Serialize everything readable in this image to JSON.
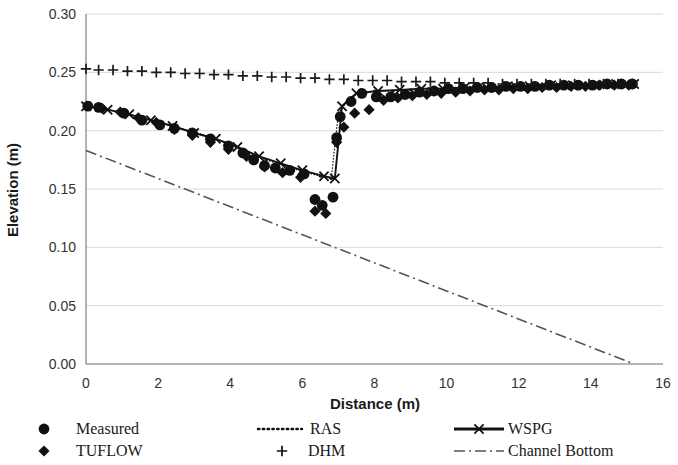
{
  "chart_data": {
    "type": "scatter",
    "title": "",
    "xlabel": "Distance (m)",
    "ylabel": "Elevation (m)",
    "xlim": [
      0,
      16
    ],
    "ylim": [
      0.0,
      0.3
    ],
    "xticks": [
      0,
      2,
      4,
      6,
      8,
      10,
      12,
      14,
      16
    ],
    "yticks": [
      0.0,
      0.05,
      0.1,
      0.15,
      0.2,
      0.25,
      0.3
    ],
    "xtick_labels": [
      "0",
      "2",
      "4",
      "6",
      "8",
      "10",
      "12",
      "14",
      "16"
    ],
    "ytick_labels": [
      "0.00",
      "0.05",
      "0.10",
      "0.15",
      "0.20",
      "0.25",
      "0.30"
    ],
    "grid": "horizontal",
    "legend_position": "bottom",
    "series": [
      {
        "name": "Measured",
        "marker": "filled-circle",
        "style": "markers",
        "color": "#111111",
        "points": [
          [
            0.05,
            0.221
          ],
          [
            0.35,
            0.22
          ],
          [
            1.05,
            0.215
          ],
          [
            1.55,
            0.209
          ],
          [
            2.05,
            0.205
          ],
          [
            2.45,
            0.202
          ],
          [
            2.95,
            0.198
          ],
          [
            3.45,
            0.193
          ],
          [
            3.95,
            0.187
          ],
          [
            4.35,
            0.181
          ],
          [
            4.65,
            0.175
          ],
          [
            4.95,
            0.17
          ],
          [
            5.25,
            0.168
          ],
          [
            5.65,
            0.166
          ],
          [
            6.05,
            0.163
          ],
          [
            6.35,
            0.141
          ],
          [
            6.55,
            0.136
          ],
          [
            6.85,
            0.143
          ],
          [
            6.95,
            0.194
          ],
          [
            7.05,
            0.212
          ],
          [
            7.35,
            0.225
          ],
          [
            7.65,
            0.232
          ],
          [
            8.05,
            0.229
          ],
          [
            8.45,
            0.229
          ],
          [
            8.85,
            0.231
          ],
          [
            9.25,
            0.233
          ],
          [
            9.65,
            0.234
          ],
          [
            10.05,
            0.236
          ],
          [
            10.45,
            0.236
          ],
          [
            10.85,
            0.237
          ],
          [
            11.25,
            0.237
          ],
          [
            11.65,
            0.238
          ],
          [
            12.05,
            0.238
          ],
          [
            12.45,
            0.238
          ],
          [
            12.85,
            0.239
          ],
          [
            13.25,
            0.239
          ],
          [
            13.65,
            0.239
          ],
          [
            14.05,
            0.239
          ],
          [
            14.45,
            0.24
          ],
          [
            14.85,
            0.24
          ],
          [
            15.15,
            0.24
          ]
        ]
      },
      {
        "name": "TUFLOW",
        "marker": "filled-diamond",
        "style": "markers",
        "color": "#111111",
        "points": [
          [
            0.45,
            0.219
          ],
          [
            0.95,
            0.216
          ],
          [
            1.45,
            0.211
          ],
          [
            1.95,
            0.207
          ],
          [
            2.45,
            0.201
          ],
          [
            2.95,
            0.196
          ],
          [
            3.45,
            0.19
          ],
          [
            3.95,
            0.184
          ],
          [
            4.45,
            0.178
          ],
          [
            4.95,
            0.169
          ],
          [
            5.45,
            0.164
          ],
          [
            5.95,
            0.16
          ],
          [
            6.35,
            0.131
          ],
          [
            6.65,
            0.129
          ],
          [
            6.95,
            0.19
          ],
          [
            7.15,
            0.203
          ],
          [
            7.45,
            0.215
          ],
          [
            7.85,
            0.218
          ],
          [
            8.25,
            0.226
          ],
          [
            8.65,
            0.228
          ],
          [
            9.05,
            0.23
          ],
          [
            9.45,
            0.231
          ],
          [
            9.85,
            0.232
          ],
          [
            10.25,
            0.233
          ],
          [
            10.65,
            0.234
          ],
          [
            11.05,
            0.235
          ],
          [
            11.45,
            0.235
          ],
          [
            11.85,
            0.236
          ],
          [
            12.25,
            0.236
          ],
          [
            12.65,
            0.237
          ],
          [
            13.05,
            0.237
          ],
          [
            13.45,
            0.238
          ],
          [
            13.85,
            0.238
          ],
          [
            14.25,
            0.239
          ],
          [
            14.65,
            0.239
          ],
          [
            15.05,
            0.239
          ]
        ]
      },
      {
        "name": "RAS",
        "marker": "small-dot",
        "style": "dotted-line",
        "color": "#1a1a1a",
        "points": [
          [
            0.0,
            0.221
          ],
          [
            0.5,
            0.219
          ],
          [
            1.0,
            0.215
          ],
          [
            1.5,
            0.211
          ],
          [
            2.0,
            0.207
          ],
          [
            2.5,
            0.203
          ],
          [
            3.0,
            0.199
          ],
          [
            3.5,
            0.194
          ],
          [
            4.0,
            0.188
          ],
          [
            4.5,
            0.181
          ],
          [
            5.0,
            0.175
          ],
          [
            5.5,
            0.17
          ],
          [
            6.0,
            0.165
          ],
          [
            6.5,
            0.161
          ],
          [
            6.8,
            0.159
          ],
          [
            7.0,
            0.215
          ],
          [
            7.3,
            0.228
          ],
          [
            7.6,
            0.233
          ],
          [
            8.0,
            0.234
          ],
          [
            8.5,
            0.234
          ],
          [
            9.0,
            0.235
          ],
          [
            9.5,
            0.236
          ],
          [
            10.0,
            0.236
          ],
          [
            10.5,
            0.237
          ],
          [
            11.0,
            0.237
          ],
          [
            11.5,
            0.238
          ],
          [
            12.0,
            0.238
          ],
          [
            12.5,
            0.238
          ],
          [
            13.0,
            0.239
          ],
          [
            13.5,
            0.239
          ],
          [
            14.0,
            0.239
          ],
          [
            14.5,
            0.24
          ],
          [
            15.0,
            0.24
          ],
          [
            15.2,
            0.24
          ]
        ]
      },
      {
        "name": "DHM",
        "marker": "plus",
        "style": "markers",
        "color": "#1a1a1a",
        "points": [
          [
            0.0,
            0.253
          ],
          [
            0.35,
            0.252
          ],
          [
            0.75,
            0.252
          ],
          [
            1.15,
            0.251
          ],
          [
            1.55,
            0.251
          ],
          [
            1.95,
            0.25
          ],
          [
            2.35,
            0.25
          ],
          [
            2.75,
            0.249
          ],
          [
            3.15,
            0.249
          ],
          [
            3.55,
            0.248
          ],
          [
            3.95,
            0.248
          ],
          [
            4.35,
            0.247
          ],
          [
            4.75,
            0.247
          ],
          [
            5.15,
            0.246
          ],
          [
            5.55,
            0.246
          ],
          [
            5.95,
            0.245
          ],
          [
            6.35,
            0.245
          ],
          [
            6.75,
            0.244
          ],
          [
            7.15,
            0.244
          ],
          [
            7.55,
            0.243
          ],
          [
            7.95,
            0.243
          ],
          [
            8.35,
            0.243
          ],
          [
            8.75,
            0.242
          ],
          [
            9.15,
            0.242
          ],
          [
            9.55,
            0.242
          ],
          [
            9.95,
            0.241
          ],
          [
            10.35,
            0.241
          ],
          [
            10.75,
            0.241
          ],
          [
            11.15,
            0.241
          ],
          [
            11.55,
            0.24
          ],
          [
            11.95,
            0.24
          ],
          [
            12.35,
            0.24
          ],
          [
            12.75,
            0.24
          ],
          [
            13.15,
            0.24
          ],
          [
            13.55,
            0.24
          ],
          [
            13.95,
            0.24
          ],
          [
            14.35,
            0.24
          ],
          [
            14.75,
            0.24
          ],
          [
            15.15,
            0.24
          ]
        ]
      },
      {
        "name": "WSPG",
        "marker": "x",
        "style": "line-with-x",
        "color": "#111111",
        "points": [
          [
            0.0,
            0.221
          ],
          [
            0.6,
            0.218
          ],
          [
            1.2,
            0.214
          ],
          [
            1.8,
            0.209
          ],
          [
            2.4,
            0.204
          ],
          [
            3.0,
            0.198
          ],
          [
            3.6,
            0.193
          ],
          [
            4.2,
            0.186
          ],
          [
            4.8,
            0.178
          ],
          [
            5.4,
            0.172
          ],
          [
            6.0,
            0.166
          ],
          [
            6.6,
            0.161
          ],
          [
            6.9,
            0.159
          ],
          [
            7.1,
            0.221
          ],
          [
            7.5,
            0.232
          ],
          [
            8.1,
            0.234
          ],
          [
            8.7,
            0.235
          ],
          [
            9.3,
            0.236
          ],
          [
            9.9,
            0.236
          ],
          [
            10.5,
            0.237
          ],
          [
            11.1,
            0.237
          ],
          [
            11.7,
            0.238
          ],
          [
            12.3,
            0.238
          ],
          [
            12.9,
            0.239
          ],
          [
            13.5,
            0.239
          ],
          [
            14.1,
            0.239
          ],
          [
            14.7,
            0.24
          ],
          [
            15.2,
            0.24
          ]
        ]
      },
      {
        "name": "Channel Bottom",
        "marker": "none",
        "style": "dash-dot-line",
        "color": "#555555",
        "points": [
          [
            0.0,
            0.183
          ],
          [
            15.2,
            0.0
          ]
        ]
      }
    ]
  },
  "axes": {
    "ylabel": "Elevation (m)",
    "xlabel": "Distance (m)"
  },
  "legend": {
    "items": [
      {
        "label": "Measured",
        "marker": "filled-circle",
        "col": 0,
        "row": 0
      },
      {
        "label": "TUFLOW",
        "marker": "filled-diamond",
        "col": 0,
        "row": 1
      },
      {
        "label": "RAS",
        "marker": "dotted-line",
        "col": 1,
        "row": 0
      },
      {
        "label": "DHM",
        "marker": "plus",
        "col": 1,
        "row": 1
      },
      {
        "label": "WSPG",
        "marker": "line-with-x",
        "col": 2,
        "row": 0
      },
      {
        "label": "Channel Bottom",
        "marker": "dash-dot-line",
        "col": 2,
        "row": 1
      }
    ]
  },
  "colors": {
    "ink": "#111111",
    "grid": "#d9d9d9",
    "axis": "#808080",
    "channel_bottom": "#555555"
  }
}
